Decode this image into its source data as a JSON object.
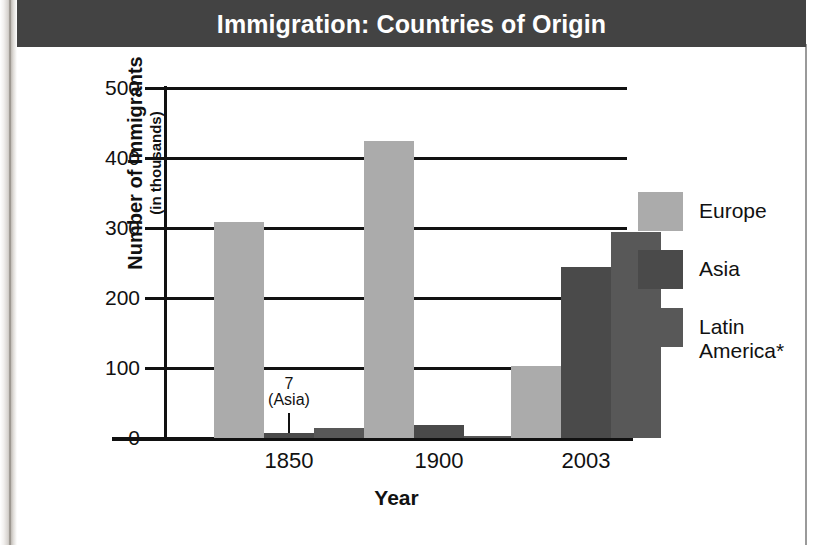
{
  "banner": {
    "title": "Immigration: Countries of Origin"
  },
  "chart_data": {
    "type": "bar",
    "title": "Immigration: Countries of Origin",
    "xlabel": "Year",
    "ylabel": "Number of Immigrants",
    "ylabel_sub": "(in thousands)",
    "categories": [
      "1850",
      "1900",
      "2003"
    ],
    "series": [
      {
        "name": "Europe",
        "color": "#ababab",
        "values": [
          308,
          424,
          103
        ]
      },
      {
        "name": "Asia",
        "color": "#4a4a4a",
        "values": [
          7,
          18,
          244
        ]
      },
      {
        "name": "Latin America*",
        "color": "#585858",
        "values": [
          15,
          3,
          294
        ]
      }
    ],
    "ylim": [
      0,
      500
    ],
    "yticks": [
      0,
      100,
      200,
      300,
      400,
      500
    ],
    "ytick_labels": [
      "0",
      "100",
      "200",
      "300",
      "400",
      "500"
    ],
    "grid": true,
    "legend_position": "right",
    "annotations": [
      {
        "value_label": "7",
        "series_label": "(Asia)",
        "points_to_series": "Asia",
        "points_to_category": "1850"
      }
    ]
  },
  "legend": {
    "items": [
      {
        "label": "Europe",
        "color": "#ababab"
      },
      {
        "label": "Asia",
        "color": "#4a4a4a"
      },
      {
        "label": "Latin\nAmerica*",
        "color": "#585858"
      }
    ]
  },
  "colors": {
    "banner_bg": "#434343",
    "banner_text": "#ffffff",
    "axis": "#111111",
    "card_bg": "#ffffff"
  }
}
